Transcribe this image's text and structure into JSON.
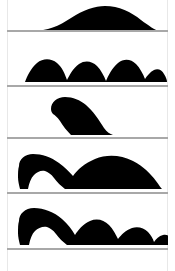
{
  "figure": {
    "title": "Loch Ness Monster sighting silhouettes",
    "width": 175,
    "height": 271,
    "background_color": "#ffffff",
    "silhouette_color": "#000000",
    "baseline_color": "#a8a8a8",
    "frame_border_color": "#e8e8e8",
    "panel_count": 5
  },
  "panels": [
    {
      "index": "1",
      "name": "single-smooth-hump",
      "label": "Single broad smooth hump",
      "description": "One wide low asymmetric mound rising from the waterline",
      "hump_count": "1",
      "has_head": "false",
      "top": 2,
      "height": 29,
      "baseline_y": 30,
      "path": "M 26 29 C 40 29 52 24 64 16 C 76 8 88 4 98 4 C 112 4 124 10 134 18 C 142 24 148 28 152 29 Z"
    },
    {
      "index": "2",
      "name": "four-descending-humps",
      "label": "Four humps in a row",
      "description": "Four rounded humps of progressively decreasing height along the waterline",
      "hump_count": "4",
      "has_head": "false",
      "top": 32,
      "height": 51,
      "baseline_y": 85,
      "path": "M 18 50 C 20 44 24 36 30 31 C 36 26 44 26 50 31 C 55 35 58 42 60 48 C 62 44 66 36 72 32 C 78 28 85 29 90 34 C 94 38 97 44 99 49 C 101 44 105 36 111 31 C 117 26 124 27 129 32 C 133 36 136 42 138 47 C 140 44 143 40 147 38 C 151 36 155 38 157 42 C 159 45 160 48 160 50 Z"
    },
    {
      "index": "3",
      "name": "head-and-neck",
      "label": "Head and neck only",
      "description": "A raised head facing left with a thick neck curving down to the right into the water",
      "hump_count": "0",
      "has_head": "true",
      "top": 87,
      "height": 48,
      "baseline_y": 137,
      "path": "M 44 22 C 44 15 50 10 58 10 C 66 10 73 13 79 18 C 86 24 92 33 97 41 C 100 45 103 47 106 48 L 64 48 C 60 44 56 39 53 34 C 50 30 48 28 46 27 C 45 26 44 24 44 22 Z"
    },
    {
      "index": "4",
      "name": "head-and-large-body-hump",
      "label": "Head, neck and one large body hump",
      "description": "Head raised at the left, a dip at the neck, then one long high body hump extending to the right",
      "hump_count": "1",
      "has_head": "true",
      "top": 139,
      "height": 51,
      "baseline_y": 192,
      "path": "M 12 27 C 12 20 18 15 26 15 C 35 15 44 18 52 24 C 58 28 62 33 66 37 C 70 31 78 24 88 20 C 100 15 114 16 126 22 C 136 27 144 35 149 42 C 152 46 154 49 155 50 L 58 50 C 54 47 50 43 47 39 C 44 35 41 33 38 32 C 34 31 30 33 27 36 C 24 39 22 44 21 50 L 13 50 C 12 46 11 42 11 38 C 11 34 11 30 12 27 Z"
    },
    {
      "index": "5",
      "name": "head-and-multiple-small-humps",
      "label": "Head, neck and several small humps",
      "description": "Head raised at the left followed by three or four progressively smaller humps trailing to the right",
      "hump_count": "4",
      "has_head": "true",
      "top": 194,
      "height": 52,
      "baseline_y": 248,
      "path": "M 12 27 C 12 20 18 14 27 14 C 37 14 47 18 55 25 C 61 30 65 36 68 41 C 71 36 76 30 83 27 C 90 24 97 26 102 31 C 106 35 109 41 111 45 C 114 41 119 36 125 34 C 131 32 137 34 141 38 C 144 41 146 45 147 48 C 149 45 152 42 156 41 C 160 40 163 42 165 46 C 166 48 166 50 166 51 L 60 51 C 56 48 52 44 49 40 C 46 36 43 34 40 33 C 36 32 31 34 28 37 C 25 40 23 45 22 51 L 13 51 C 12 47 11 43 11 39 C 11 34 11 30 12 27 Z"
    }
  ],
  "dividers": [
    {
      "name": "baseline-1",
      "y": 30
    },
    {
      "name": "baseline-2",
      "y": 85
    },
    {
      "name": "baseline-3",
      "y": 137
    },
    {
      "name": "baseline-4",
      "y": 192
    },
    {
      "name": "baseline-5",
      "y": 248
    }
  ]
}
